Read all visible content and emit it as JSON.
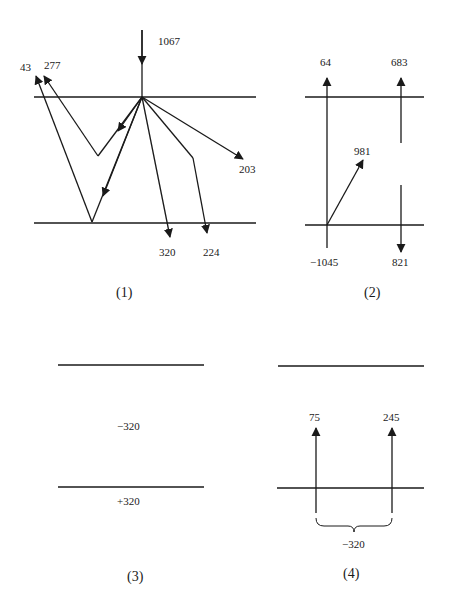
{
  "panels": [
    {
      "caption": "(1)",
      "labels": {
        "incident": "1067",
        "ray_43": "43",
        "ray_277": "277",
        "ray_320": "320",
        "ray_224": "224",
        "ray_203": "203"
      }
    },
    {
      "caption": "(2)",
      "labels": {
        "left_top": "64",
        "right_top": "683",
        "diagonal": "981",
        "left_bottom": "−1045",
        "right_bottom": "821"
      }
    },
    {
      "caption": "(3)",
      "labels": {
        "between": "−320",
        "below": "+320"
      }
    },
    {
      "caption": "(4)",
      "labels": {
        "left_arrow": "75",
        "right_arrow": "245",
        "brace": "−320"
      }
    }
  ]
}
